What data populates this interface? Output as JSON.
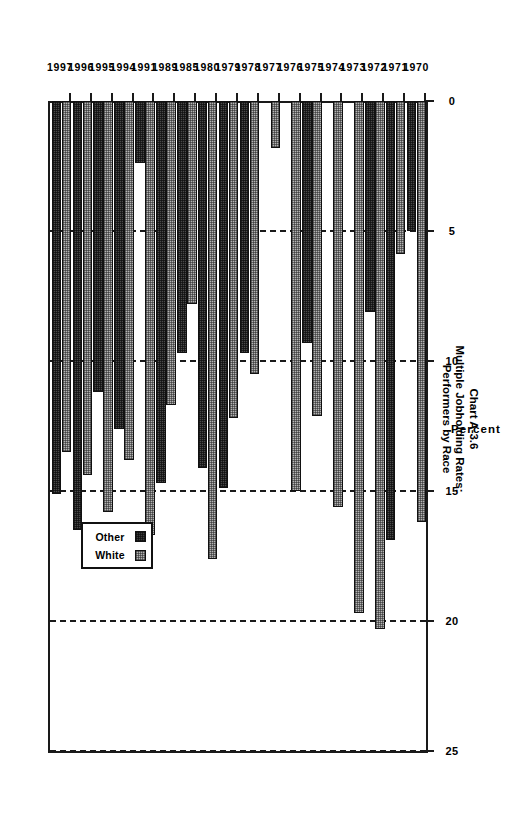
{
  "title": {
    "line1": "Chart A-3.6",
    "line2": "Multiple Jobholding Rates:",
    "line3": "Performers by Race"
  },
  "axis": {
    "value_axis_name": "Percent",
    "value_ticks": [
      "0",
      "5",
      "10",
      "15",
      "20",
      "25"
    ]
  },
  "legend": {
    "items": [
      {
        "label": "White",
        "swatch": "light-hatched-swatch"
      },
      {
        "label": "Other",
        "swatch": "dark-hatched-swatch"
      }
    ]
  },
  "chart_data": {
    "type": "bar",
    "orientation": "horizontal",
    "title": "Chart A-3.6 Multiple Jobholding Rates: Performers by Race",
    "xlabel": "Percent",
    "ylabel": "",
    "xlim": [
      0,
      25
    ],
    "xticks": [
      0,
      5,
      10,
      15,
      20,
      25
    ],
    "grid": "dashed vertical gridlines at 5, 10, 15, 20, 25",
    "legend_position": "bottom-right inside plot",
    "categories": [
      "1970",
      "1971",
      "1972",
      "1973",
      "1974",
      "1975",
      "1976",
      "1977",
      "1978",
      "1979",
      "1980",
      "1985",
      "1989",
      "1991",
      "1994",
      "1995",
      "1996",
      "1997"
    ],
    "series": [
      {
        "name": "White",
        "values": [
          16.2,
          5.9,
          20.3,
          19.7,
          15.6,
          12.1,
          15.0,
          1.8,
          10.5,
          12.2,
          17.6,
          7.8,
          11.7,
          16.7,
          13.8,
          15.8,
          14.4,
          13.5
        ]
      },
      {
        "name": "Other",
        "values": [
          5.0,
          16.9,
          8.1,
          0,
          0,
          9.3,
          0,
          0,
          9.7,
          14.9,
          14.1,
          9.7,
          14.7,
          2.4,
          12.6,
          11.2,
          16.5,
          15.1
        ]
      }
    ]
  }
}
